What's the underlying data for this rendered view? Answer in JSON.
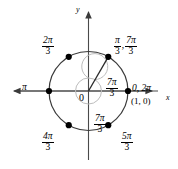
{
  "figure": {
    "type": "unit-circle-diagram",
    "axis_labels": {
      "x": "x",
      "y": "y"
    },
    "origin_label": "0",
    "colors": {
      "stroke": "#3a3a3a",
      "inner_arc": "#b9b9b9",
      "point": "#000000",
      "axis": "#555555"
    },
    "center": {
      "x": 88.5,
      "y": 91
    },
    "radius": 39.5,
    "inner_radius": 13,
    "terminal_ray_angle_deg": 60,
    "points": [
      {
        "id": "pi-over-3",
        "angle_deg": 60,
        "label_primary": "π",
        "label_den": "3"
      },
      {
        "id": "2pi-over-3",
        "angle_deg": 120,
        "label_primary": "2π",
        "label_den": "3"
      },
      {
        "id": "pi",
        "angle_deg": 180,
        "label_primary": "π",
        "label_den": ""
      },
      {
        "id": "4pi-over-3",
        "angle_deg": 240,
        "label_primary": "4π",
        "label_den": "3"
      },
      {
        "id": "5pi-over-3",
        "angle_deg": 300,
        "label_primary": "5π",
        "label_den": "3"
      },
      {
        "id": "0-2pi",
        "angle_deg": 0,
        "label_primary": "0, 2π",
        "label_den": ""
      }
    ],
    "labels": {
      "two_pi_over_three_num": "2π",
      "two_pi_over_three_den": "3",
      "pi_left": "π",
      "four_pi_over_three_num": "4π",
      "four_pi_over_three_den": "3",
      "pi_over_three_num": "π",
      "pi_over_three_den": "3",
      "seven_pi_over_three_num": "7π",
      "seven_pi_over_three_den": "3",
      "comma": ",",
      "zero_two_pi": "0, 2π",
      "point_one_zero": "(1, 0)",
      "inner_seven_pi_num": "7π",
      "inner_seven_pi_den": "3",
      "bottom_seven_pi_num": "7π",
      "bottom_seven_pi_den": "3",
      "five_pi_over_three_num": "5π",
      "five_pi_over_three_den": "3",
      "origin": "0",
      "x_axis": "x",
      "y_axis": "y"
    }
  }
}
